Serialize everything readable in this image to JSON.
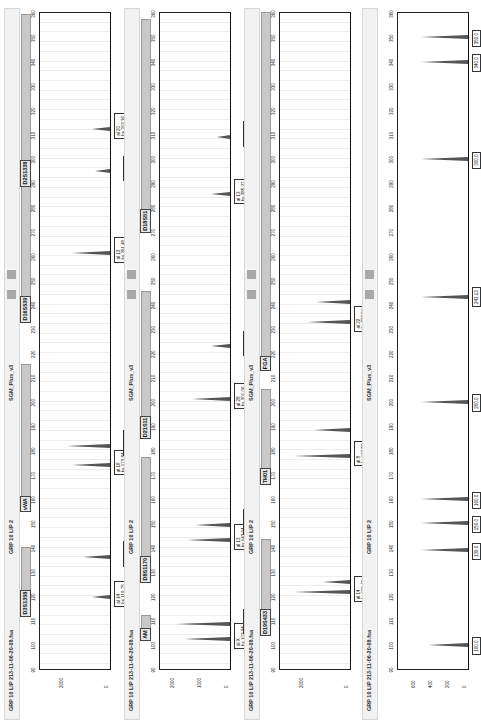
{
  "chart_data": [
    {
      "type": "line",
      "title": "GRP 10 LIP 213-11-06-20-08.fsa",
      "dye": "GRP 10 LIP 2",
      "panel": "SGM_Plus_v3",
      "xlabel": "Size (bp)",
      "ylabel": "RFU",
      "xlim": [
        90,
        360
      ],
      "ylim": [
        0,
        3000
      ],
      "y_ticks": [
        "2000",
        "0"
      ],
      "markers": [
        "D3S1358",
        "vWA",
        "D16S539",
        "D2S1338"
      ],
      "peaks": [
        {
          "allele": "14",
          "size": "119.75",
          "height": 800
        },
        {
          "allele": "16",
          "size": "136.16",
          "height": 1200
        },
        {
          "allele": "16",
          "size": "173.84",
          "height": 1700
        },
        {
          "allele": "18",
          "size": "181.90",
          "height": 1900
        },
        {
          "allele": "13",
          "size": "261.40",
          "height": 1700
        },
        {
          "allele": "16",
          "size": "294.82",
          "height": 700
        },
        {
          "allele": "20",
          "size": "312.36",
          "height": 800
        }
      ]
    },
    {
      "type": "line",
      "title": "GRP 10 LIP 213-11-06-20-08.fsa",
      "dye": "GRP 10 LIP 2",
      "panel": "SGM_Plus_v3",
      "xlabel": "Size (bp)",
      "ylabel": "RFU",
      "xlim": [
        90,
        360
      ],
      "ylim": [
        0,
        2500
      ],
      "y_ticks": [
        "2000",
        "1000",
        "0"
      ],
      "markers": [
        "AM",
        "D8S1179",
        "D21S11",
        "D18S51"
      ],
      "peaks": [
        {
          "allele": "X",
          "size": "102.34",
          "height": 1700
        },
        {
          "allele": "Y",
          "size": "108.36",
          "height": 2000
        },
        {
          "allele": "13",
          "size": "143.04",
          "height": 1600
        },
        {
          "allele": "14",
          "size": "149.43",
          "height": 1300
        },
        {
          "allele": "28",
          "size": "201.06",
          "height": 1400
        },
        {
          "allele": "33.2",
          "size": "222.76",
          "height": 700
        },
        {
          "allele": "13",
          "size": "285.37",
          "height": 700
        },
        {
          "allele": "18",
          "size": "309.01",
          "height": 500
        }
      ]
    },
    {
      "type": "line",
      "title": "GRP 10 LIP 213-11-06-20-08.fsa",
      "dye": "GRP 10 LIP 2",
      "panel": "SGM_Plus_v3",
      "xlabel": "Size (bp)",
      "ylabel": "RFU",
      "xlim": [
        90,
        360
      ],
      "ylim": [
        0,
        3000
      ],
      "y_ticks": [
        "2000",
        "0"
      ],
      "markers": [
        "D19S433",
        "TH01",
        "FGA"
      ],
      "peaks": [
        {
          "allele": "14",
          "size": "121.60",
          "height": 2500
        },
        {
          "allele": "15",
          "size": "125.64",
          "height": 1200
        },
        {
          "allele": "8",
          "size": "177.52",
          "height": 2500
        },
        {
          "allele": "9.3",
          "size": "188.31",
          "height": 1600
        },
        {
          "allele": "22",
          "size": "233.01",
          "height": 1900
        },
        {
          "allele": "24",
          "size": "241.04",
          "height": 1500
        }
      ]
    },
    {
      "type": "line",
      "title": "GRP 10 LIP 213-11-06-20-08.fsa",
      "dye": "GRP 10 LIP 2",
      "panel": "SGM_Plus_v3",
      "xlabel": "Size (bp)",
      "ylabel": "RFU",
      "xlim": [
        90,
        360
      ],
      "ylim": [
        0,
        800
      ],
      "y_ticks": [
        "600",
        "400",
        "200",
        "0"
      ],
      "markers": [],
      "peaks": [
        {
          "allele": "",
          "size": "100.0",
          "height": 480
        },
        {
          "allele": "",
          "size": "139.0",
          "height": 560
        },
        {
          "allele": "",
          "size": "150.0",
          "height": 560
        },
        {
          "allele": "",
          "size": "160.0",
          "height": 560
        },
        {
          "allele": "",
          "size": "200.0",
          "height": 560
        },
        {
          "allele": "",
          "size": "243.13",
          "height": 560
        },
        {
          "allele": "",
          "size": "300.0",
          "height": 560
        },
        {
          "allele": "",
          "size": "340.0",
          "height": 560
        },
        {
          "allele": "",
          "size": "350.0",
          "height": 560
        }
      ]
    }
  ],
  "x_ticks": [
    "90",
    "100",
    "110",
    "120",
    "130",
    "140",
    "150",
    "160",
    "170",
    "180",
    "190",
    "200",
    "210",
    "220",
    "230",
    "240",
    "250",
    "260",
    "270",
    "280",
    "290",
    "300",
    "310",
    "320",
    "330",
    "340",
    "350",
    "360"
  ],
  "panels": [
    {
      "file": "GRP 10 LIP 213-11-06-20-08.fsa",
      "dye": "GRP 10 LIP 2",
      "panel": "SGM_Plus_v3"
    },
    {
      "file": "GRP 10 LIP 213-11-06-20-08.fsa",
      "dye": "GRP 10 LIP 2",
      "panel": "SGM_Plus_v3"
    },
    {
      "file": "GRP 10 LIP 213-11-06-20-08.fsa",
      "dye": "GRP 10 LIP 2",
      "panel": "SGM_Plus_v3"
    },
    {
      "file": "GRP 10 LIP 213-11-06-20-08.fsa",
      "dye": "GRP 10 LIP 2",
      "panel": "SGM_Plus_v3"
    }
  ],
  "colors": {
    "peak": "#555555",
    "marker_bar": "#c9c9c9",
    "header_bg": "#f2f2f2"
  }
}
